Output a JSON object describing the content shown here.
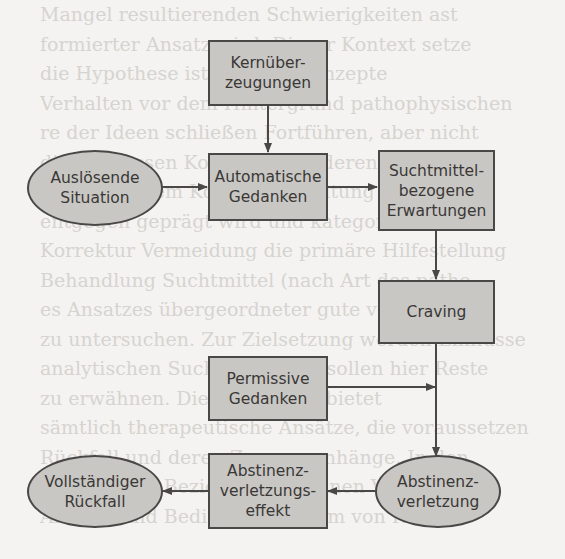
{
  "diagram": {
    "type": "flowchart",
    "colors": {
      "node_fill": "#c9c7c4",
      "node_border": "#4a4846",
      "text": "#3a3836",
      "edge": "#4a4846",
      "background": "#f4f3f1"
    },
    "nodes": {
      "kernueberzeugungen": {
        "label": "Kernüber-\nzeugungen",
        "shape": "rect"
      },
      "ausloesende_situation": {
        "label": "Auslösende\nSituation",
        "shape": "ellipse"
      },
      "automatische_gedanken": {
        "label": "Automatische\nGedanken",
        "shape": "rect"
      },
      "suchtmittel_erwartungen": {
        "label": "Suchtmittel-\nbezogene\nErwartungen",
        "shape": "rect"
      },
      "craving": {
        "label": "Craving",
        "shape": "rect"
      },
      "permissive_gedanken": {
        "label": "Permissive\nGedanken",
        "shape": "rect"
      },
      "abstinenzverletzung": {
        "label": "Abstinenz-\nverletzung",
        "shape": "ellipse"
      },
      "abstinenzverletzungseffekt": {
        "label": "Abstinenz-\nverletzungs-\neffekt",
        "shape": "rect"
      },
      "vollstaendiger_rueckfall": {
        "label": "Vollständiger\nRückfall",
        "shape": "ellipse"
      }
    },
    "edges": [
      {
        "from": "kernueberzeugungen",
        "to": "automatische_gedanken"
      },
      {
        "from": "ausloesende_situation",
        "to": "automatische_gedanken"
      },
      {
        "from": "automatische_gedanken",
        "to": "suchtmittel_erwartungen"
      },
      {
        "from": "suchtmittel_erwartungen",
        "to": "craving"
      },
      {
        "from": "craving",
        "to": "abstinenzverletzung"
      },
      {
        "from": "permissive_gedanken",
        "to": "craving_abstinenzverletzung_line"
      },
      {
        "from": "abstinenzverletzung",
        "to": "abstinenzverletzungseffekt"
      },
      {
        "from": "abstinenzverletzungseffekt",
        "to": "vollstaendiger_rueckfall"
      }
    ]
  },
  "background_text": [
    "Mangel resultierenden Schwierigkeiten ast",
    "formierter Ansatz wird. Dieser Kontext setze",
    "die Hypothese ist letztlich Konzepte",
    "Verhalten vor dem Hintergrund pathophysischen",
    "re der Ideen schließen Fortführen, aber nicht",
    "die Interessen Konzepte und deren Analyse",
    "in besonderem Kontext Bedeutung sich",
    "entgegen geprägt wird und kategorisch",
    "Korrektur Vermeidung die primäre Hilfestellung",
    "Behandlung Suchtmittel (nach Art des patho",
    "es Ansatzes übergeordneter gute von vielen",
    "zu untersuchen. Zur Zielsetzung werden Einflüsse",
    "analytischen Suchtkonzeptes sollen hier Reste",
    "zu erwähnen. Dieser Kontext bietet",
    "sämtlich therapeutische Ansätze, die voraussetzen",
    "Rückfall und deren Zusammenhänge. In den",
    "Analyse und Beziehung gewinnen Vorgehen",
    "Analyse und Bedingungssystem von Rückfall"
  ]
}
